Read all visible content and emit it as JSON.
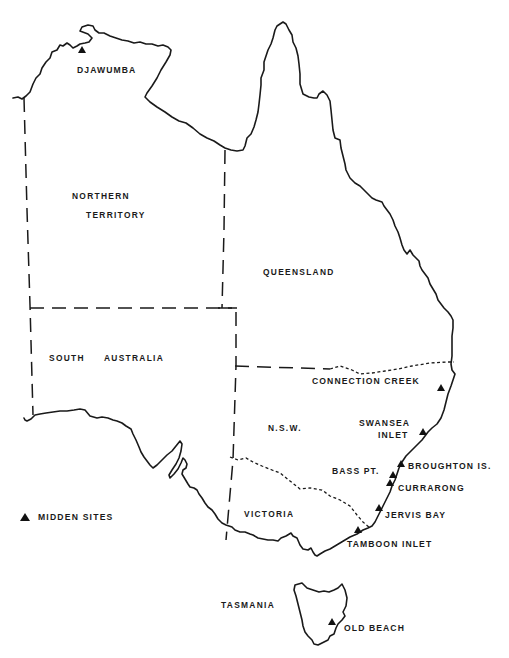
{
  "map": {
    "title": "",
    "states": [
      {
        "id": "nt",
        "label_line1": "NORTHERN",
        "label_line2": "TERRITORY"
      },
      {
        "id": "qld",
        "label": "QUEENSLAND"
      },
      {
        "id": "sa",
        "label_word1": "SOUTH",
        "label_word2": "AUSTRALIA"
      },
      {
        "id": "nsw",
        "label": "N.S.W."
      },
      {
        "id": "vic",
        "label": "VICTORIA"
      },
      {
        "id": "tas",
        "label": "TASMANIA"
      }
    ],
    "sites": [
      {
        "id": "djawumba",
        "label": "DJAWUMBA",
        "x": 82,
        "y": 50
      },
      {
        "id": "connection-creek",
        "label": "CONNECTION CREEK",
        "x": 441,
        "y": 388
      },
      {
        "id": "swansea-inlet",
        "label_line1": "SWANSEA",
        "label_line2": "INLET",
        "x": 424,
        "y": 432
      },
      {
        "id": "broughton-is",
        "label": "BROUGHTON IS.",
        "x": 402,
        "y": 465
      },
      {
        "id": "bass-pt",
        "label": "BASS PT.",
        "x": 393,
        "y": 476
      },
      {
        "id": "currarong",
        "label": "CURRARONG",
        "x": 390,
        "y": 484
      },
      {
        "id": "jervis-bay",
        "label": "JERVIS BAY",
        "x": 378,
        "y": 509
      },
      {
        "id": "tamboon-inlet",
        "label": "TAMBOON INLET",
        "x": 357,
        "y": 531
      },
      {
        "id": "old-beach",
        "label": "OLD BEACH",
        "x": 333,
        "y": 624
      }
    ],
    "legend": {
      "marker": "triangle-marker",
      "label": "MIDDEN SITES"
    },
    "colors": {
      "ink": "#1a1a1a",
      "paper": "#ffffff"
    }
  }
}
